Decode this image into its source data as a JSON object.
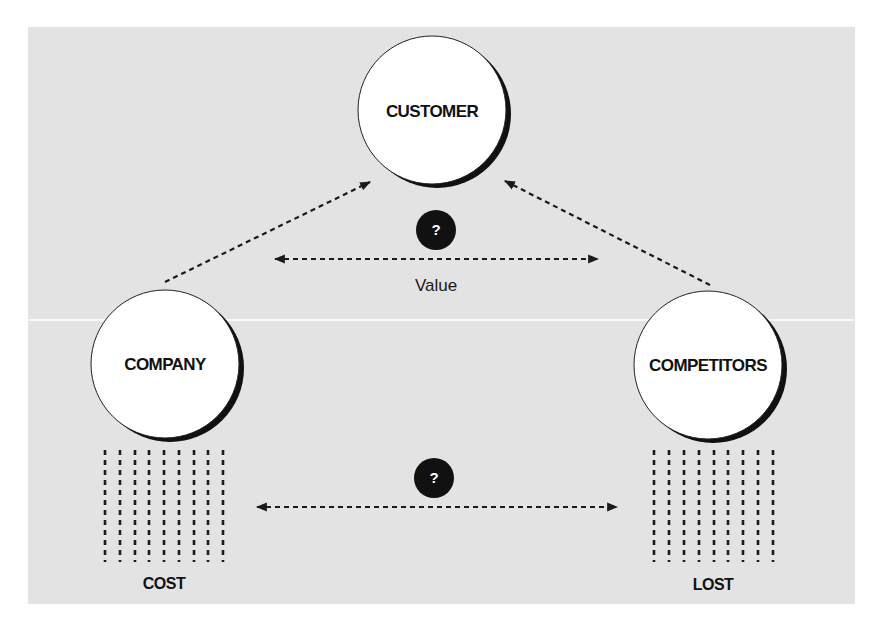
{
  "diagram": {
    "nodes": {
      "customer": {
        "label": "CUSTOMER"
      },
      "company": {
        "label": "COMPANY"
      },
      "competitors": {
        "label": "COMPETITORS"
      }
    },
    "upper_comparison": {
      "marker": "?",
      "label": "Value"
    },
    "lower_comparison": {
      "marker": "?"
    },
    "cost_block": {
      "label": "COST",
      "columns": 9
    },
    "lost_block": {
      "label": "LOST",
      "columns": 9
    },
    "colors": {
      "panel": "#e3e3e3",
      "ink": "#111111",
      "node_fill": "#ffffff"
    }
  }
}
